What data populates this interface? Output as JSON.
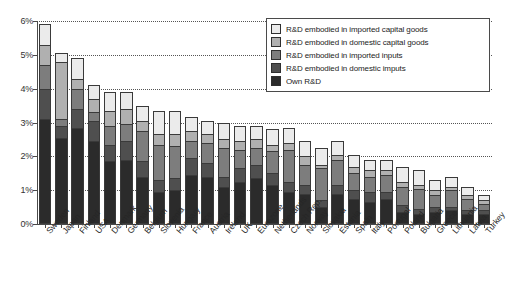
{
  "chart_data": {
    "type": "bar",
    "stacked": true,
    "title": "",
    "subtitle": "",
    "xlabel": "",
    "ylabel": "",
    "ylim": [
      0,
      6
    ],
    "yticks": [
      "0%",
      "1%",
      "2%",
      "3%",
      "4%",
      "5%",
      "6%"
    ],
    "ytick_values": [
      0,
      1,
      2,
      3,
      4,
      5,
      6
    ],
    "grid": true,
    "legend_position": "top-right",
    "categories": [
      "Sweden",
      "Japan",
      "Finland",
      "USA",
      "Denmark",
      "Germany",
      "Belgium",
      "Slovenia",
      "Hungary",
      "France",
      "Austria",
      "Ireland",
      "UK",
      "Eurozone",
      "Netherlands",
      "Czech Rep.",
      "Norway",
      "Slovakia",
      "Estonia",
      "Spain",
      "Italy",
      "Portugal",
      "Poland",
      "Bulgaria",
      "Greece",
      "Lithuania",
      "Latvia",
      "Turkey"
    ],
    "series": [
      {
        "name": "Own R&D",
        "color": "#2b2b2b",
        "values": [
          3.1,
          2.55,
          2.85,
          2.45,
          1.85,
          1.9,
          1.4,
          0.95,
          1.0,
          1.45,
          1.4,
          1.1,
          1.25,
          1.35,
          1.15,
          0.95,
          0.9,
          0.5,
          0.9,
          0.75,
          0.65,
          0.75,
          0.35,
          0.3,
          0.35,
          0.4,
          0.3,
          0.3
        ]
      },
      {
        "name": "R&D embodied in domestic imputs",
        "color": "#4f4f4f",
        "values": [
          0.9,
          0.35,
          0.55,
          0.6,
          0.5,
          0.55,
          0.45,
          0.35,
          0.35,
          0.5,
          0.4,
          0.3,
          0.4,
          0.4,
          0.35,
          0.3,
          0.25,
          0.2,
          0.25,
          0.25,
          0.3,
          0.2,
          0.2,
          0.15,
          0.15,
          0.1,
          0.1,
          0.1
        ]
      },
      {
        "name": "R&D embodied in imported inputs",
        "color": "#7d7d7d",
        "values": [
          0.7,
          0.2,
          0.6,
          0.25,
          0.55,
          0.5,
          0.9,
          1.05,
          0.95,
          0.5,
          0.6,
          0.85,
          0.55,
          0.5,
          0.65,
          0.95,
          0.6,
          0.95,
          0.75,
          0.5,
          0.45,
          0.5,
          0.55,
          0.6,
          0.35,
          0.5,
          0.35,
          0.2
        ]
      },
      {
        "name": "R&D embodied in domestic capital goods",
        "color": "#b0b0b0",
        "values": [
          0.6,
          1.7,
          0.3,
          0.4,
          0.45,
          0.45,
          0.3,
          0.3,
          0.35,
          0.3,
          0.25,
          0.25,
          0.25,
          0.25,
          0.2,
          0.2,
          0.25,
          0.1,
          0.15,
          0.2,
          0.2,
          0.15,
          0.15,
          0.1,
          0.15,
          0.1,
          0.1,
          0.1
        ]
      },
      {
        "name": "R&D embodied in imported capital goods",
        "color": "#ebebeb",
        "values": [
          0.6,
          0.25,
          0.6,
          0.4,
          0.55,
          0.5,
          0.45,
          0.7,
          0.7,
          0.4,
          0.4,
          0.5,
          0.45,
          0.4,
          0.45,
          0.45,
          0.45,
          0.5,
          0.4,
          0.35,
          0.3,
          0.3,
          0.45,
          0.45,
          0.3,
          0.3,
          0.25,
          0.15
        ]
      }
    ],
    "totals": [
      5.9,
      5.05,
      4.9,
      4.1,
      3.9,
      3.9,
      3.5,
      3.35,
      3.35,
      3.15,
      3.05,
      3.0,
      2.9,
      2.9,
      2.8,
      2.85,
      2.45,
      2.25,
      2.45,
      2.05,
      1.9,
      1.9,
      1.7,
      1.6,
      1.3,
      1.4,
      1.1,
      0.85
    ]
  },
  "legend": {
    "items": [
      {
        "label": "R&D embodied in imported capital goods",
        "color": "#ebebeb"
      },
      {
        "label": "R&D embodied in domestic capital goods",
        "color": "#b0b0b0"
      },
      {
        "label": "R&D embodied in imported inputs",
        "color": "#7d7d7d"
      },
      {
        "label": "R&D embodied in domestic imputs",
        "color": "#4f4f4f"
      },
      {
        "label": "Own R&D",
        "color": "#2b2b2b"
      }
    ]
  }
}
